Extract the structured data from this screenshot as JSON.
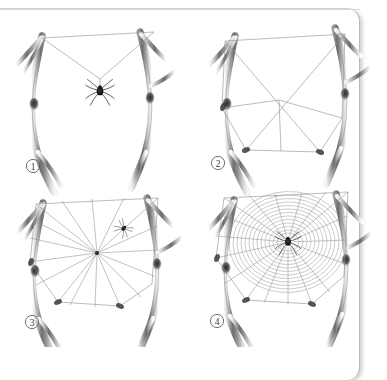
{
  "figure": {
    "background_color": "#ffffff",
    "ink_color": "#5a5a5a",
    "thread_color": "#8d8d8d",
    "branch_dark": "#4a4a4a",
    "branch_light": "#d5d5d5",
    "spider_color": "#1d1d1d"
  },
  "panels": [
    {
      "id": "panel-1",
      "number": "1",
      "caption": "1",
      "stage_name": "bridge-thread-and-drop-line",
      "subject": "spider suspended on drop line below bridge thread",
      "has_spider": true,
      "spider_position": "hanging mid-air on vertical drag line",
      "thread_count_visible": 4
    },
    {
      "id": "panel-2",
      "number": "2",
      "caption": "2",
      "stage_name": "frame-threads",
      "subject": "outer frame threads anchored to branches",
      "has_spider": false,
      "spider_position": "",
      "thread_count_visible": 11
    },
    {
      "id": "panel-3",
      "number": "3",
      "caption": "3",
      "stage_name": "radial-spokes",
      "subject": "radial spokes converging on central hub",
      "has_spider": true,
      "spider_position": "on upper right radius",
      "thread_count_visible": 18
    },
    {
      "id": "panel-4",
      "number": "4",
      "caption": "4",
      "stage_name": "capture-spiral-complete",
      "subject": "completed orb web with capture spiral and spider at hub",
      "has_spider": true,
      "spider_position": "centre of hub",
      "thread_count_visible": 40
    }
  ]
}
